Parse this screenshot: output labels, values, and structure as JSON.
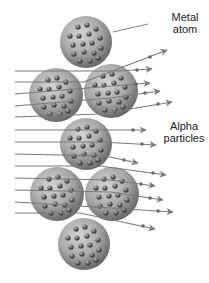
{
  "labels": {
    "metal_line1": "Metal",
    "metal_line2": "atom",
    "alpha_line1": "Alpha",
    "alpha_line2": "particles"
  },
  "colors": {
    "background": "#ffffff",
    "atom_light": "#c8c8c8",
    "atom_dark": "#6a6a6a",
    "nucleus": "#555555",
    "arrow": "#7a7a7a",
    "text": "#222222"
  },
  "atoms": [
    {
      "id": "top",
      "cx": 86,
      "cy": 42,
      "r": 26
    },
    {
      "id": "row2-left",
      "cx": 56,
      "cy": 95,
      "r": 27
    },
    {
      "id": "row2-right",
      "cx": 111,
      "cy": 91,
      "r": 27
    },
    {
      "id": "middle",
      "cx": 86,
      "cy": 144,
      "r": 26
    },
    {
      "id": "row4-left",
      "cx": 57,
      "cy": 194,
      "r": 27
    },
    {
      "id": "row4-right",
      "cx": 112,
      "cy": 194,
      "r": 27
    },
    {
      "id": "bottom",
      "cx": 84,
      "cy": 244,
      "r": 26
    }
  ],
  "alpha_paths": [
    {
      "y0": 71,
      "x1": 152,
      "y1": 69
    },
    {
      "y0": 82,
      "x1": 167,
      "y1": 50
    },
    {
      "y0": 94,
      "x1": 150,
      "y1": 83
    },
    {
      "y0": 106,
      "x1": 160,
      "y1": 91
    },
    {
      "y0": 117,
      "x1": 172,
      "y1": 102
    },
    {
      "y0": 130,
      "x1": 146,
      "y1": 130
    },
    {
      "y0": 142,
      "x1": 156,
      "y1": 145
    },
    {
      "y0": 154,
      "x1": 138,
      "y1": 163
    },
    {
      "y0": 166,
      "x1": 166,
      "y1": 175
    },
    {
      "y0": 178,
      "x1": 155,
      "y1": 186
    },
    {
      "y0": 190,
      "x1": 163,
      "y1": 200
    },
    {
      "y0": 202,
      "x1": 173,
      "y1": 212
    },
    {
      "y0": 213,
      "x1": 155,
      "y1": 229
    }
  ]
}
